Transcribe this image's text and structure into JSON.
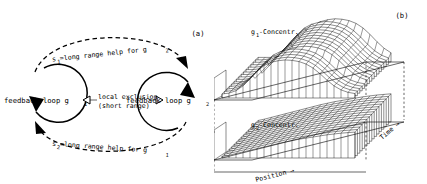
{
  "figure": {
    "panels": [
      {
        "id": "a",
        "label": "(a)",
        "type": "feedback-loop-diagram",
        "nodes": [
          {
            "id": "g1",
            "label": "feedback loop g",
            "subscript": "1"
          },
          {
            "id": "g2",
            "label": "feedback loop g",
            "subscript": "2"
          }
        ],
        "edges": [
          {
            "id": "s1",
            "position": "top",
            "style": "dashed-arc",
            "prefix": "s",
            "prefix_sub": "1",
            "text": "=long range help for g",
            "text_sub": "2",
            "direction": "g1-to-g2"
          },
          {
            "id": "s2",
            "position": "bottom",
            "style": "dashed-arc",
            "prefix": "s",
            "prefix_sub": "2",
            "text": "=long range help for g",
            "text_sub": "1",
            "direction": "g2-to-g1"
          },
          {
            "id": "local-exclusion",
            "position": "middle",
            "style": "open-triangle-arrows-both",
            "line1": "local exclusion",
            "line2": "(short range)"
          }
        ]
      },
      {
        "id": "b",
        "label": "(b)",
        "type": "surface-3d-pair",
        "surfaces": [
          {
            "id": "g1-surface",
            "label_main": "g",
            "label_sub": "1",
            "label_rest": "-Concentr.",
            "position": "upper"
          },
          {
            "id": "g2-surface",
            "label_main": "g",
            "label_sub": "2",
            "label_rest": "-Concentr.",
            "position": "lower"
          }
        ],
        "axes": {
          "x": "Position →",
          "y": "Time →"
        }
      }
    ]
  },
  "chart_data": {
    "type": "surface",
    "title": "",
    "panels": [
      {
        "name": "g1-Concentr.",
        "xlabel": "Position →",
        "ylabel": "Time →",
        "zlabel": "g1-Concentr.",
        "description": "Spatio-temporal 3D mesh surface of g1 concentration: a broad travelling front/peak that rises near mid-position and widens over time.",
        "profile_z": [
          0.1,
          0.12,
          0.18,
          0.3,
          0.48,
          0.66,
          0.8,
          0.88,
          0.92,
          0.94,
          0.93,
          0.9,
          0.84,
          0.74,
          0.6,
          0.44,
          0.3,
          0.2,
          0.14,
          0.11
        ]
      },
      {
        "name": "g2-Concentr.",
        "xlabel": "Position →",
        "ylabel": "Time →",
        "zlabel": "g2-Concentr.",
        "description": "Spatio-temporal 3D mesh surface of g2 concentration: a monotonically rising staircase/ramp in position, nearly constant over time.",
        "profile_z": [
          0.05,
          0.1,
          0.16,
          0.22,
          0.28,
          0.34,
          0.4,
          0.46,
          0.52,
          0.58,
          0.63,
          0.68,
          0.72,
          0.76,
          0.8,
          0.84,
          0.87,
          0.9,
          0.92,
          0.94
        ]
      }
    ]
  },
  "colors": {
    "ink": "#000000",
    "background": "#ffffff"
  }
}
